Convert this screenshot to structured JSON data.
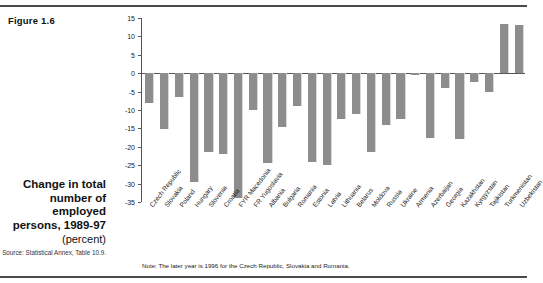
{
  "figure": {
    "number_label": "Figure 1.6",
    "caption_title": "Change in total number of employed persons, 1989-97",
    "caption_unit": "(percent)",
    "source": "Source: Statistical Annex, Table 10.9.",
    "note": "Note: The later year is 1996 for the Czech Republic, Slovakia and Romania."
  },
  "colors": {
    "bar": "#8d8d8d",
    "axis": "#555555",
    "rule": "#4a4a4a",
    "text": "#111111"
  },
  "chart_data": {
    "type": "bar",
    "title": "Change in total number of employed persons, 1989-97",
    "xlabel": "",
    "ylabel": "(percent)",
    "ylim": [
      -35,
      15
    ],
    "ytick_labels": [
      "15",
      "10",
      "5",
      "0",
      "-5",
      "-10",
      "-15",
      "-20",
      "-25",
      "-30",
      "-35"
    ],
    "yticks": [
      15,
      10,
      5,
      0,
      -5,
      -10,
      -15,
      -20,
      -25,
      -30,
      -35
    ],
    "grid": false,
    "legend": null,
    "categories": [
      "Czech Republic",
      "Slovakia",
      "Poland",
      "Hungary",
      "Slovenia",
      "Croatia",
      "FYR Macedonia",
      "FR Yugoslavia",
      "Albania",
      "Bulgaria",
      "Romania",
      "Estonia",
      "Latvia",
      "Lithuania",
      "Belarus",
      "Moldova",
      "Russia",
      "Ukraine",
      "Armenia",
      "Azerbaijan",
      "Georgia",
      "Kazakhstan",
      "Kyrgyzstan",
      "Tajikistan",
      "Turkmenistan",
      "Uzbekistan"
    ],
    "values": [
      -8.0,
      -15.2,
      -6.5,
      -29.5,
      -21.5,
      -22.0,
      -34.0,
      -10.0,
      -24.5,
      -14.5,
      -9.0,
      -24.0,
      -25.0,
      -12.5,
      -11.0,
      -21.5,
      -14.0,
      -12.5,
      -0.5,
      -17.5,
      -4.0,
      -18.0,
      -2.5,
      -5.0,
      13.5,
      13.0
    ]
  }
}
